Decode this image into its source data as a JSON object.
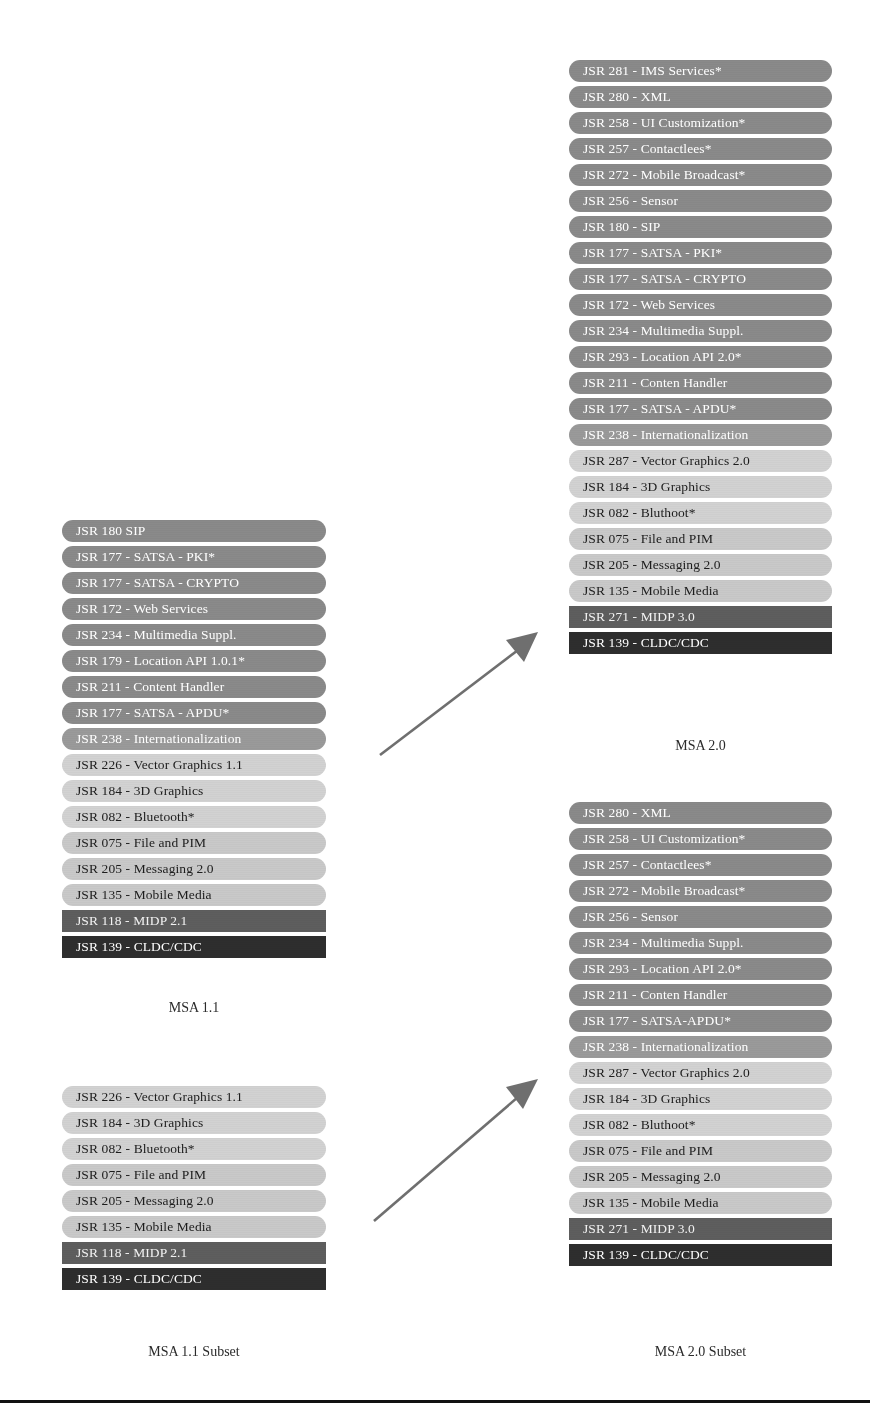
{
  "diagram": {
    "colors": {
      "bar_dark": "#8a8a8a",
      "bar_mid": "#9a9a9a",
      "bar_light": "#c9c9c9",
      "bar_lighter": "#d2d2d2",
      "bar_midp": "#5e5e5e",
      "bar_cldc": "#2e2e2e",
      "arrow": "#6f6f6f",
      "rule": "#111111",
      "background": "#ffffff"
    }
  },
  "columns": [
    {
      "id": "msa-11",
      "caption": "MSA 1.1",
      "bars": [
        {
          "label": "JSR 180 SIP",
          "tone": "t-dark"
        },
        {
          "label": "JSR 177 - SATSA - PKI*",
          "tone": "t-dark"
        },
        {
          "label": "JSR 177 - SATSA - CRYPTO",
          "tone": "t-dark"
        },
        {
          "label": "JSR 172 - Web Services",
          "tone": "t-dark"
        },
        {
          "label": "JSR 234 - Multimedia Suppl.",
          "tone": "t-dark"
        },
        {
          "label": "JSR 179 - Location API 1.0.1*",
          "tone": "t-dark"
        },
        {
          "label": "JSR 211 - Content Handler",
          "tone": "t-dark"
        },
        {
          "label": "JSR 177 - SATSA - APDU*",
          "tone": "t-dark"
        },
        {
          "label": "JSR 238 - Internationalization",
          "tone": "t-mid"
        },
        {
          "label": "JSR 226 - Vector Graphics 1.1",
          "tone": "t-lighter"
        },
        {
          "label": "JSR 184 - 3D Graphics",
          "tone": "t-lighter"
        },
        {
          "label": "JSR 082 - Bluetooth*",
          "tone": "t-lighter"
        },
        {
          "label": "JSR 075 - File and PIM",
          "tone": "t-light"
        },
        {
          "label": "JSR 205 - Messaging 2.0",
          "tone": "t-light"
        },
        {
          "label": "JSR 135 - Mobile Media",
          "tone": "t-light"
        },
        {
          "label": "JSR 118 - MIDP 2.1",
          "tone": "t-midp"
        },
        {
          "label": "JSR 139 - CLDC/CDC",
          "tone": "t-cldc"
        }
      ]
    },
    {
      "id": "msa-20",
      "caption": "MSA 2.0",
      "bars": [
        {
          "label": "JSR 281 - IMS Services*",
          "tone": "t-dark"
        },
        {
          "label": "JSR 280 - XML",
          "tone": "t-dark"
        },
        {
          "label": "JSR 258 - UI Customization*",
          "tone": "t-dark"
        },
        {
          "label": "JSR 257 - Contactlees*",
          "tone": "t-dark"
        },
        {
          "label": "JSR 272 - Mobile Broadcast*",
          "tone": "t-dark"
        },
        {
          "label": "JSR 256 - Sensor",
          "tone": "t-dark"
        },
        {
          "label": "JSR 180 - SIP",
          "tone": "t-dark"
        },
        {
          "label": "JSR 177 - SATSA - PKI*",
          "tone": "t-dark"
        },
        {
          "label": "JSR 177 - SATSA - CRYPTO",
          "tone": "t-dark"
        },
        {
          "label": "JSR 172 - Web Services",
          "tone": "t-dark"
        },
        {
          "label": "JSR 234 - Multimedia Suppl.",
          "tone": "t-dark"
        },
        {
          "label": "JSR 293 - Location API 2.0*",
          "tone": "t-dark"
        },
        {
          "label": "JSR 211 - Conten Handler",
          "tone": "t-dark"
        },
        {
          "label": "JSR 177 - SATSA - APDU*",
          "tone": "t-dark"
        },
        {
          "label": "JSR 238 - Internationalization",
          "tone": "t-mid"
        },
        {
          "label": "JSR 287 - Vector Graphics 2.0",
          "tone": "t-lighter"
        },
        {
          "label": "JSR 184 - 3D Graphics",
          "tone": "t-lighter"
        },
        {
          "label": "JSR 082 - Bluthoot*",
          "tone": "t-lighter"
        },
        {
          "label": "JSR 075 - File and PIM",
          "tone": "t-light"
        },
        {
          "label": "JSR 205 - Messaging 2.0",
          "tone": "t-light"
        },
        {
          "label": "JSR 135 - Mobile Media",
          "tone": "t-light"
        },
        {
          "label": "JSR 271 - MIDP 3.0",
          "tone": "t-midp"
        },
        {
          "label": "JSR 139 - CLDC/CDC",
          "tone": "t-cldc"
        }
      ]
    },
    {
      "id": "msa-11-subset",
      "caption": "MSA 1.1 Subset",
      "bars": [
        {
          "label": "JSR 226 - Vector Graphics 1.1",
          "tone": "t-lighter"
        },
        {
          "label": "JSR 184 - 3D Graphics",
          "tone": "t-lighter"
        },
        {
          "label": "JSR 082 - Bluetooth*",
          "tone": "t-lighter"
        },
        {
          "label": "JSR 075 - File and PIM",
          "tone": "t-light"
        },
        {
          "label": "JSR 205 - Messaging 2.0",
          "tone": "t-light"
        },
        {
          "label": "JSR 135 - Mobile Media",
          "tone": "t-light"
        },
        {
          "label": "JSR 118 - MIDP 2.1",
          "tone": "t-midp"
        },
        {
          "label": "JSR 139 - CLDC/CDC",
          "tone": "t-cldc"
        }
      ]
    },
    {
      "id": "msa-20-subset",
      "caption": "MSA 2.0 Subset",
      "bars": [
        {
          "label": "JSR 280 - XML",
          "tone": "t-dark"
        },
        {
          "label": "JSR 258 - UI Customization*",
          "tone": "t-dark"
        },
        {
          "label": "JSR 257 - Contactlees*",
          "tone": "t-dark"
        },
        {
          "label": "JSR 272 - Mobile Broadcast*",
          "tone": "t-dark"
        },
        {
          "label": "JSR 256 - Sensor",
          "tone": "t-dark"
        },
        {
          "label": "JSR 234 - Multimedia Suppl.",
          "tone": "t-dark"
        },
        {
          "label": "JSR 293 - Location API 2.0*",
          "tone": "t-dark"
        },
        {
          "label": "JSR 211 - Conten Handler",
          "tone": "t-dark"
        },
        {
          "label": "JSR 177 - SATSA-APDU*",
          "tone": "t-dark"
        },
        {
          "label": "JSR 238 - Internationalization",
          "tone": "t-mid"
        },
        {
          "label": "JSR 287 - Vector Graphics 2.0",
          "tone": "t-lighter"
        },
        {
          "label": "JSR 184 - 3D Graphics",
          "tone": "t-lighter"
        },
        {
          "label": "JSR 082 - Bluthoot*",
          "tone": "t-lighter"
        },
        {
          "label": "JSR 075 - File and PIM",
          "tone": "t-light"
        },
        {
          "label": "JSR 205 - Messaging 2.0",
          "tone": "t-light"
        },
        {
          "label": "JSR 135 - Mobile Media",
          "tone": "t-light"
        },
        {
          "label": "JSR 271 - MIDP 3.0",
          "tone": "t-midp"
        },
        {
          "label": "JSR 139 - CLDC/CDC",
          "tone": "t-cldc"
        }
      ]
    }
  ],
  "arrows": [
    {
      "id": "arrow-upper",
      "from": "MSA 1.1",
      "to": "MSA 2.0"
    },
    {
      "id": "arrow-lower",
      "from": "MSA 1.1 Subset",
      "to": "MSA 2.0 Subset"
    }
  ]
}
